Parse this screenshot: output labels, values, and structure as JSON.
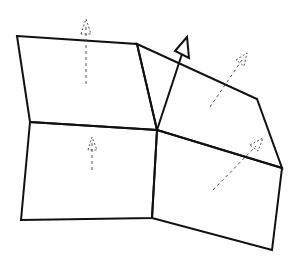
{
  "diagram": {
    "title": "Vertex normal from adjacent face normals",
    "width": 299,
    "height": 264,
    "colors": {
      "background": "#ffffff",
      "edge": "#111111",
      "face_normal": "#555555",
      "vertex_normal": "#111111"
    },
    "shared_vertex": {
      "x": 157,
      "y": 130
    },
    "faces": [
      {
        "id": "face-top-left",
        "points": "17,36 137,44 157,130 30,122"
      },
      {
        "id": "face-bottom-left",
        "points": "30,122 157,130 152,218 21,220"
      },
      {
        "id": "face-top-right",
        "points": "137,44 257,99 282,168 157,130"
      },
      {
        "id": "face-bottom-right",
        "points": "157,130 282,168 272,250 152,218"
      }
    ],
    "face_normals": [
      {
        "id": "face-normal-top-left",
        "x1": 86,
        "y1": 84,
        "x2": 86,
        "y2": 26,
        "head": "81,34 86,19 91,34"
      },
      {
        "id": "face-normal-bottom-left",
        "x1": 92,
        "y1": 170,
        "x2": 92,
        "y2": 143,
        "head": "88,150 92,137 97,150"
      },
      {
        "id": "face-normal-top-right",
        "x1": 210,
        "y1": 107,
        "x2": 242,
        "y2": 60,
        "head": "236,60 247,53 244,66"
      },
      {
        "id": "face-normal-bottom-right",
        "x1": 213,
        "y1": 190,
        "x2": 256,
        "y2": 146,
        "head": "250,145 263,138 258,151"
      }
    ],
    "vertex_normal": {
      "x1": 157,
      "y1": 130,
      "x2": 182,
      "y2": 54,
      "head": "175,51 187,37 189,58"
    }
  }
}
